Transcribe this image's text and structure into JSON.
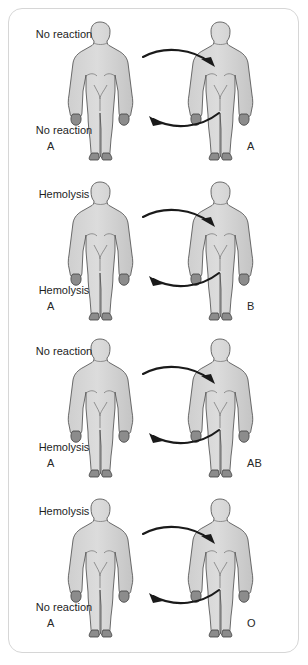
{
  "diagram": {
    "panel_border_color": "#d6d6d6",
    "body_fill_color": "#d2d2d2",
    "body_outline_color": "#5a5a5a",
    "arrow_color": "#1a1a1a",
    "text_color": "#1e1e1e",
    "rows": [
      {
        "left_type": "A",
        "right_type": "A",
        "forward_label": "No reaction",
        "reverse_label": "No reaction"
      },
      {
        "left_type": "A",
        "right_type": "B",
        "forward_label": "Hemolysis",
        "reverse_label": "Hemolysis"
      },
      {
        "left_type": "A",
        "right_type": "AB",
        "forward_label": "No reaction",
        "reverse_label": "Hemolysis"
      },
      {
        "left_type": "A",
        "right_type": "O",
        "forward_label": "Hemolysis",
        "reverse_label": "No reaction"
      }
    ]
  }
}
